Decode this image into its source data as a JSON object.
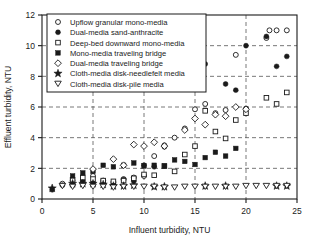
{
  "chart_data": {
    "type": "scatter",
    "title": "",
    "xlabel": "Influent turbidity, NTU",
    "ylabel": "Effluent turbidity, NTU",
    "xlim": [
      0,
      25
    ],
    "ylim": [
      0,
      12
    ],
    "xticks": [
      0,
      5,
      10,
      15,
      20,
      25
    ],
    "yticks": [
      0,
      2,
      4,
      6,
      8,
      10,
      12
    ],
    "grid": true,
    "grid_style": "dashed",
    "legend_position": "upper-left",
    "series": [
      {
        "name": "Upflow granular mono-media",
        "marker": "open-circle",
        "points": [
          [
            2,
            1.0
          ],
          [
            3,
            0.9
          ],
          [
            4,
            1.1
          ],
          [
            5,
            1.5
          ],
          [
            6,
            1.2
          ],
          [
            7,
            1.1
          ],
          [
            8,
            1.3
          ],
          [
            9,
            1.4
          ],
          [
            10,
            1.5
          ],
          [
            11,
            2.8
          ],
          [
            12,
            3.5
          ],
          [
            13,
            4.0
          ],
          [
            14,
            4.6
          ],
          [
            15,
            5.85
          ],
          [
            16,
            6.2
          ],
          [
            17,
            5.6
          ],
          [
            18,
            5.8
          ],
          [
            19,
            9.4
          ],
          [
            20,
            5.9
          ],
          [
            22,
            10.5
          ],
          [
            22.3,
            11.0
          ],
          [
            23,
            11.0
          ],
          [
            24,
            11.0
          ]
        ]
      },
      {
        "name": "Dual-media sand-anthracite",
        "marker": "filled-circle",
        "points": [
          [
            1,
            0.6
          ],
          [
            2,
            0.9
          ],
          [
            3,
            1.2
          ],
          [
            4,
            1.2
          ],
          [
            5,
            1.1
          ],
          [
            6,
            1.1
          ],
          [
            7,
            0.95
          ],
          [
            8,
            1.25
          ],
          [
            9,
            1.15
          ],
          [
            10,
            2.2
          ],
          [
            11,
            2.1
          ],
          [
            12,
            3.4
          ],
          [
            15,
            8.25
          ],
          [
            16,
            8.8
          ],
          [
            18,
            7.5
          ],
          [
            19,
            7.1
          ],
          [
            20,
            10.0
          ],
          [
            22,
            10.6
          ],
          [
            23,
            8.65
          ],
          [
            24,
            9.3
          ]
        ]
      },
      {
        "name": "Deep-bed downward mono-media",
        "marker": "open-square",
        "points": [
          [
            3,
            1.25
          ],
          [
            4,
            1.4
          ],
          [
            5,
            1.3
          ],
          [
            6,
            1.2
          ],
          [
            7,
            1.15
          ],
          [
            8,
            1.2
          ],
          [
            9,
            1.35
          ],
          [
            10,
            1.6
          ],
          [
            11,
            1.55
          ],
          [
            12,
            2.15
          ],
          [
            13,
            1.8
          ],
          [
            14,
            2.9
          ],
          [
            15,
            3.45
          ],
          [
            16,
            5.75
          ],
          [
            17,
            4.4
          ],
          [
            18,
            3.95
          ],
          [
            19,
            5.15
          ],
          [
            20,
            5.6
          ],
          [
            22,
            6.6
          ],
          [
            23,
            6.2
          ],
          [
            24,
            6.95
          ]
        ]
      },
      {
        "name": "Mono-media traveling bridge",
        "marker": "filled-square",
        "points": [
          [
            3,
            1.5
          ],
          [
            4,
            1.7
          ],
          [
            5,
            1.8
          ],
          [
            6,
            2.2
          ],
          [
            7,
            2.1
          ],
          [
            8,
            2.2
          ],
          [
            9,
            2.35
          ],
          [
            10,
            2.15
          ],
          [
            11,
            2.2
          ],
          [
            12,
            2.15
          ],
          [
            13,
            2.55
          ],
          [
            14,
            2.45
          ],
          [
            15,
            2.25
          ],
          [
            16,
            2.7
          ],
          [
            17,
            3.05
          ],
          [
            18,
            2.8
          ],
          [
            19,
            3.3
          ]
        ]
      },
      {
        "name": "Dual-media traveling bridge",
        "marker": "open-diamond",
        "points": [
          [
            5,
            1.95
          ],
          [
            7,
            2.6
          ],
          [
            8,
            2.2
          ],
          [
            9,
            3.55
          ],
          [
            10,
            3.45
          ],
          [
            11,
            3.7
          ],
          [
            12,
            3.45
          ],
          [
            14,
            4.5
          ],
          [
            15,
            5.25
          ],
          [
            16,
            4.85
          ],
          [
            17,
            5.5
          ],
          [
            18,
            5.4
          ],
          [
            19,
            6.0
          ],
          [
            20,
            5.85
          ]
        ]
      },
      {
        "name": "Cloth-media disk-needlefelt media",
        "marker": "filled-star",
        "points": [
          [
            1,
            0.7
          ],
          [
            3,
            1.0
          ],
          [
            4,
            1.0
          ],
          [
            5,
            1.0
          ],
          [
            6,
            0.95
          ],
          [
            7,
            0.85
          ],
          [
            8,
            0.85
          ],
          [
            9,
            0.9
          ],
          [
            11,
            0.8
          ],
          [
            12,
            0.8
          ],
          [
            16,
            0.85
          ],
          [
            18,
            0.85
          ],
          [
            23,
            0.85
          ],
          [
            24,
            0.85
          ]
        ]
      },
      {
        "name": "Cloth-media disk-pile media",
        "marker": "open-triangle-down",
        "points": [
          [
            2,
            0.85
          ],
          [
            3,
            0.8
          ],
          [
            4,
            0.85
          ],
          [
            5,
            0.8
          ],
          [
            6,
            0.8
          ],
          [
            7,
            0.75
          ],
          [
            8,
            0.8
          ],
          [
            9,
            0.8
          ],
          [
            10,
            0.8
          ],
          [
            11,
            0.8
          ],
          [
            12,
            0.75
          ],
          [
            13,
            0.75
          ],
          [
            14,
            0.8
          ],
          [
            15,
            0.8
          ],
          [
            16,
            0.8
          ],
          [
            17,
            0.8
          ],
          [
            18,
            0.8
          ],
          [
            19,
            0.8
          ],
          [
            20,
            0.85
          ],
          [
            21,
            0.85
          ],
          [
            22,
            0.85
          ],
          [
            23,
            0.85
          ],
          [
            24,
            0.85
          ]
        ]
      }
    ]
  },
  "axes": {
    "x_label": "Influent turbidity, NTU",
    "y_label": "Effluent turbidity, NTU",
    "x_tick_labels": [
      "0",
      "5",
      "10",
      "15",
      "20",
      "25"
    ],
    "y_tick_labels": [
      "0",
      "2",
      "4",
      "6",
      "8",
      "10",
      "12"
    ]
  },
  "legend": {
    "items": [
      {
        "label": "Upflow granular mono-media",
        "marker": "open-circle"
      },
      {
        "label": "Dual-media sand-anthracite",
        "marker": "filled-circle"
      },
      {
        "label": "Deep-bed downward mono-media",
        "marker": "open-square"
      },
      {
        "label": "Mono-media traveling bridge",
        "marker": "filled-square"
      },
      {
        "label": "Dual-media traveling bridge",
        "marker": "open-diamond"
      },
      {
        "label": "Cloth-media disk-needlefelt media",
        "marker": "filled-star"
      },
      {
        "label": "Cloth-media disk-pile media",
        "marker": "open-triangle-down"
      }
    ]
  },
  "colors": {
    "ink": "#1a1a1a",
    "grid": "#555555",
    "background": "#ffffff"
  }
}
